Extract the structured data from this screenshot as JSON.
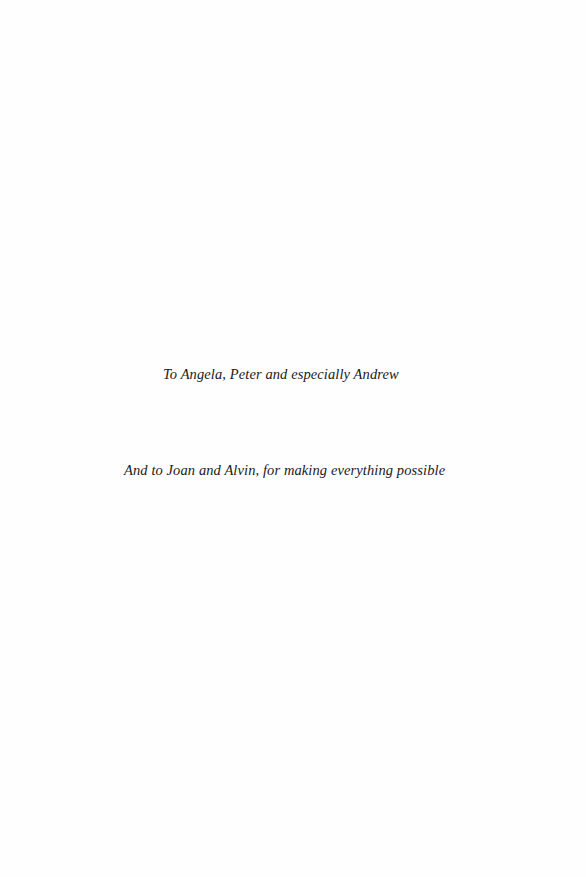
{
  "dedication": {
    "lines": [
      "To Angela, Peter and especially Andrew",
      "And to Joan and Alvin, for making everything possible"
    ]
  }
}
